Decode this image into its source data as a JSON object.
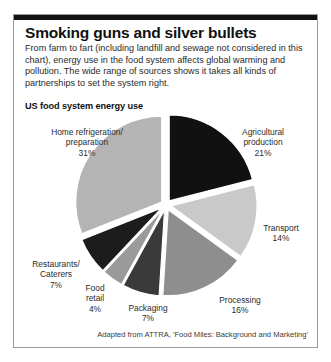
{
  "panel": {
    "headline": "Smoking guns and silver bullets",
    "standfirst": "From farm to fart (including landfill and sewage not considered in this chart), energy use in the food system affects global warming and pollution. The wide range of sources shows it takes all kinds of partnerships to set the system right.",
    "subhead": "US food system energy use",
    "credit": "Adapted from ATTRA, 'Food Miles: Background and Marketing'"
  },
  "chart_data": {
    "type": "pie",
    "title": "US food system energy use",
    "exploded": true,
    "start_angle_deg": 0,
    "direction": "clockwise",
    "unit": "%",
    "legend": "none (labels placed around slices)",
    "categories": [
      "Agricultural production",
      "Transport",
      "Processing",
      "Packaging",
      "Food retail",
      "Restaurants/Caterers",
      "Home refrigeration/preparation"
    ],
    "values": [
      21,
      14,
      16,
      7,
      4,
      7,
      31
    ],
    "slices": [
      {
        "label": "Agricultural\nproduction",
        "name": "Agricultural production",
        "value": 21,
        "pct": "21%",
        "color": "#111111"
      },
      {
        "label": "Transport",
        "name": "Transport",
        "value": 14,
        "pct": "14%",
        "color": "#c9c9c9"
      },
      {
        "label": "Processing",
        "name": "Processing",
        "value": 16,
        "pct": "16%",
        "color": "#8e8e8e"
      },
      {
        "label": "Packaging",
        "name": "Packaging",
        "value": 7,
        "pct": "7%",
        "color": "#3a3a3a"
      },
      {
        "label": "Food\nretail",
        "name": "Food retail",
        "value": 4,
        "pct": "4%",
        "color": "#9a9a9a"
      },
      {
        "label": "Restaurants/\nCaterers",
        "name": "Restaurants/Caterers",
        "value": 7,
        "pct": "7%",
        "color": "#1c1c1c"
      },
      {
        "label": "Home refrigeration/\npreparation",
        "name": "Home refrigeration/preparation",
        "value": 31,
        "pct": "31%",
        "color": "#b4b4b4"
      }
    ]
  },
  "colors": {
    "rule": "#111111",
    "border": "#9a9a9a",
    "text": "#2b2b2b",
    "background": "#ffffff"
  }
}
